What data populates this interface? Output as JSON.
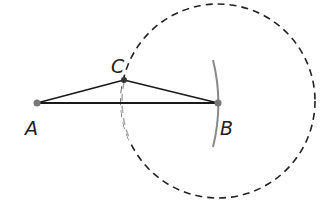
{
  "diagram": {
    "points": {
      "A": {
        "label": "A",
        "x": 37,
        "y": 103
      },
      "B": {
        "label": "B",
        "x": 218,
        "y": 103
      },
      "C": {
        "label": "C",
        "x": 124,
        "y": 78
      }
    },
    "circle": {
      "center": "B",
      "radius": 97,
      "style": "dashed"
    },
    "arc": {
      "center": "A",
      "radius": 181,
      "style": "solid-gray"
    },
    "segments": [
      "AB",
      "AC",
      "CB"
    ],
    "colors": {
      "line": "#1a1a1a",
      "arc": "#808080",
      "point": "#777777",
      "dashed": "#222222"
    }
  }
}
